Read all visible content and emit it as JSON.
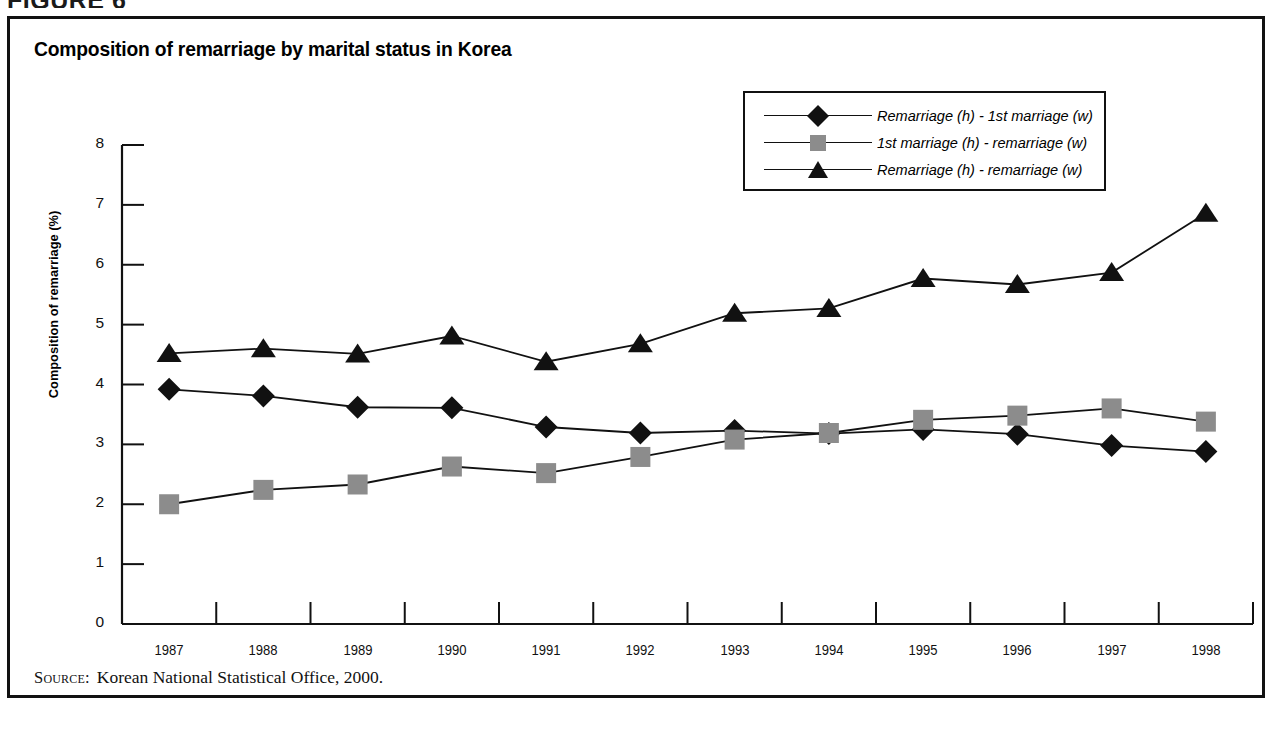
{
  "figure": {
    "label": "FIGURE 6",
    "title": "Composition of remarriage by marital status in Korea",
    "source_label": "Source:",
    "source_text": "Korean National Statistical Office, 2000."
  },
  "legend": {
    "items": [
      {
        "label": "Remarriage (h) - 1st marriage (w)",
        "marker": "diamond-marker",
        "color": "#111111"
      },
      {
        "label": "1st marriage (h) - remarriage (w)",
        "marker": "square-marker",
        "color": "#8c8c8c"
      },
      {
        "label": "Remarriage (h) - remarriage (w)",
        "marker": "triangle-marker",
        "color": "#111111"
      }
    ]
  },
  "chart_data": {
    "type": "line",
    "title": "Composition of remarriage by marital status in Korea",
    "xlabel": "",
    "ylabel": "Composition of remarriage (%)",
    "categories": [
      "1987",
      "1988",
      "1989",
      "1990",
      "1991",
      "1992",
      "1993",
      "1994",
      "1995",
      "1996",
      "1997",
      "1998"
    ],
    "ylim": [
      0,
      8
    ],
    "yticks": [
      0,
      1,
      2,
      3,
      4,
      5,
      6,
      7,
      8
    ],
    "grid": false,
    "legend_position": "top-right",
    "series": [
      {
        "name": "Remarriage (h) - 1st marriage (w)",
        "marker": "diamond",
        "color": "#111111",
        "values": [
          3.92,
          3.81,
          3.62,
          3.61,
          3.29,
          3.19,
          3.23,
          3.18,
          3.25,
          3.17,
          2.98,
          2.88
        ]
      },
      {
        "name": "1st marriage (h) - remarriage (w)",
        "marker": "square",
        "color": "#8c8c8c",
        "values": [
          2.0,
          2.24,
          2.33,
          2.63,
          2.52,
          2.79,
          3.08,
          3.19,
          3.41,
          3.48,
          3.6,
          3.38
        ]
      },
      {
        "name": "Remarriage (h) - remarriage (w)",
        "marker": "triangle",
        "color": "#111111",
        "values": [
          4.52,
          4.6,
          4.51,
          4.81,
          4.38,
          4.68,
          5.19,
          5.27,
          5.77,
          5.67,
          5.87,
          6.86
        ]
      }
    ]
  }
}
